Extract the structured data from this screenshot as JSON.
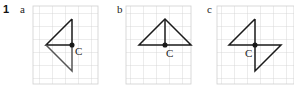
{
  "question": {
    "number": "1"
  },
  "panels": [
    {
      "label": "a",
      "center_label": "C"
    },
    {
      "label": "b",
      "center_label": "C"
    },
    {
      "label": "c",
      "center_label": "C"
    }
  ],
  "colors": {
    "grid": "#cfcfcf",
    "shape": "#1a1a1a",
    "text": "#222222"
  }
}
